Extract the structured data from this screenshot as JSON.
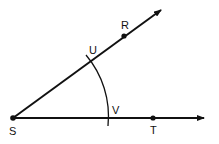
{
  "diagram": {
    "type": "geometry-angle-construction",
    "vertex": {
      "label": "S"
    },
    "rays": [
      {
        "name": "SR",
        "point_label": "R"
      },
      {
        "name": "ST",
        "point_label": "T"
      }
    ],
    "arc_intersections": [
      {
        "label": "U",
        "on_ray": "SR"
      },
      {
        "label": "V",
        "on_ray": "ST"
      }
    ],
    "labels": {
      "S": "S",
      "R": "R",
      "T": "T",
      "U": "U",
      "V": "V"
    },
    "colors": {
      "stroke": "#111111",
      "background": "#ffffff"
    }
  }
}
